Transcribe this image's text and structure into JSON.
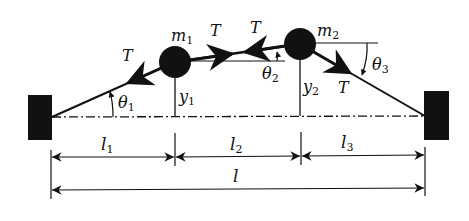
{
  "diagram": {
    "masses": [
      {
        "label": "m",
        "sub": "1"
      },
      {
        "label": "m",
        "sub": "2"
      }
    ],
    "tensions": [
      {
        "label": "T"
      },
      {
        "label": "T"
      },
      {
        "label": "T"
      },
      {
        "label": "T"
      }
    ],
    "angles": [
      {
        "label": "θ",
        "sub": "1"
      },
      {
        "label": "θ",
        "sub": "2"
      },
      {
        "label": "θ",
        "sub": "3"
      }
    ],
    "heights": [
      {
        "label": "y",
        "sub": "1"
      },
      {
        "label": "y",
        "sub": "2"
      }
    ],
    "segments": [
      {
        "label": "l",
        "sub": "1"
      },
      {
        "label": "l",
        "sub": "2"
      },
      {
        "label": "l",
        "sub": "3"
      }
    ],
    "total_length": {
      "label": "l"
    },
    "colors": {
      "ink": "#111111",
      "background": "#ffffff"
    }
  }
}
